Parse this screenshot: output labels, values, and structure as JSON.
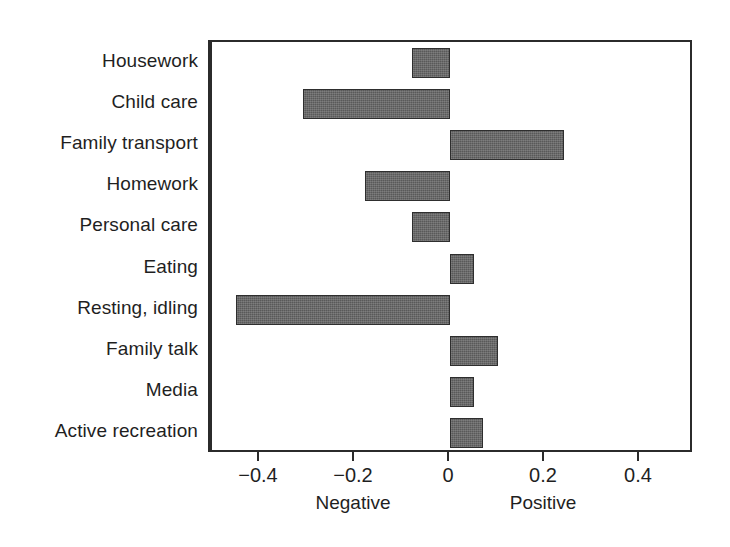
{
  "chart_data": {
    "type": "bar",
    "orientation": "horizontal",
    "title": "",
    "xlabel": "",
    "ylabel": "",
    "xlim": [
      -0.51,
      0.51
    ],
    "grid": false,
    "legend": null,
    "bar_color": "#595959",
    "frame_color": "#2b2b2b",
    "categories": [
      "Housework",
      "Child care",
      "Family transport",
      "Homework",
      "Personal care",
      "Eating",
      "Resting, idling",
      "Family talk",
      "Media",
      "Active recreation"
    ],
    "values": [
      -0.08,
      -0.31,
      0.24,
      -0.18,
      -0.08,
      0.05,
      -0.45,
      0.1,
      0.05,
      0.07
    ],
    "xticks": [
      -0.4,
      -0.2,
      0,
      0.2,
      0.4
    ],
    "xticklabels": [
      "−0.4",
      "−0.2",
      "0",
      "0.2",
      "0.4"
    ],
    "axis_captions": [
      {
        "text": "Negative",
        "at": -0.2
      },
      {
        "text": "Positive",
        "at": 0.2
      }
    ]
  }
}
